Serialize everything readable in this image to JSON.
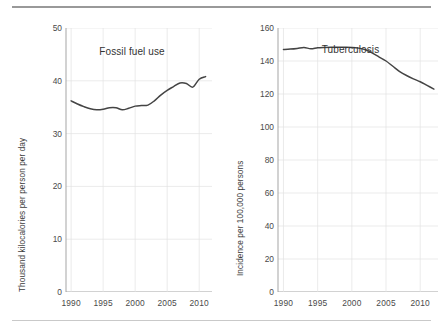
{
  "figure": {
    "top_rule_color": "#999999",
    "bottom_rule_color": "#c9c9c9",
    "background": "#ffffff",
    "line_color": "#444444",
    "grid_color": "#e2e2e2",
    "axis_color": "#9b9b9b"
  },
  "chart_data": [
    {
      "type": "line",
      "title": "Fossil fuel use",
      "xlabel": "",
      "ylabel": "Thousand kilocalories per person per day",
      "xlim": [
        1989.2,
        2012.0
      ],
      "ylim": [
        0,
        50
      ],
      "yticks": [
        0,
        10,
        20,
        30,
        40,
        50
      ],
      "ytick_labels": [
        "0",
        "10",
        "20",
        "30",
        "40",
        "50"
      ],
      "xticks": [
        1990,
        1995,
        2000,
        2005,
        2010
      ],
      "xtick_labels": [
        "1990",
        "1995",
        "2000",
        "2005",
        "2010"
      ],
      "grid": true,
      "legend": "none",
      "series": [
        {
          "name": "Fossil fuel use",
          "x": [
            1990,
            1991,
            1992,
            1993,
            1994,
            1995,
            1996,
            1997,
            1998,
            1999,
            2000,
            2001,
            2002,
            2003,
            2004,
            2005,
            2006,
            2007,
            2008,
            2009,
            2010,
            2011
          ],
          "values": [
            36.2,
            35.6,
            35.1,
            34.7,
            34.5,
            34.6,
            34.9,
            34.9,
            34.5,
            34.8,
            35.2,
            35.3,
            35.4,
            36.2,
            37.3,
            38.2,
            38.9,
            39.6,
            39.5,
            38.8,
            40.3,
            40.8
          ]
        }
      ]
    },
    {
      "type": "line",
      "title": "Tuberculosis",
      "xlabel": "",
      "ylabel": "Incidence per 100,000 persons",
      "xlim": [
        1989.2,
        2012.6
      ],
      "ylim": [
        0,
        160
      ],
      "yticks": [
        0,
        20,
        40,
        60,
        80,
        100,
        120,
        140,
        160
      ],
      "ytick_labels": [
        "0",
        "20",
        "40",
        "60",
        "80",
        "100",
        "120",
        "140",
        "160"
      ],
      "xticks": [
        1990,
        1995,
        2000,
        2005,
        2010
      ],
      "xtick_labels": [
        "1990",
        "1995",
        "2000",
        "2005",
        "2010"
      ],
      "grid": true,
      "legend": "none",
      "series": [
        {
          "name": "Tuberculosis incidence",
          "x": [
            1990,
            1991,
            1992,
            1993,
            1994,
            1995,
            1996,
            1997,
            1998,
            1999,
            2000,
            2001,
            2002,
            2003,
            2004,
            2005,
            2006,
            2007,
            2008,
            2009,
            2010,
            2011,
            2012
          ],
          "values": [
            147.0,
            147.2,
            147.6,
            148.2,
            147.4,
            148.0,
            148.2,
            148.3,
            148.3,
            148.3,
            148.2,
            147.8,
            146.8,
            144.8,
            142.4,
            140.0,
            136.8,
            133.6,
            131.2,
            129.2,
            127.4,
            125.2,
            123.0
          ]
        }
      ]
    }
  ]
}
